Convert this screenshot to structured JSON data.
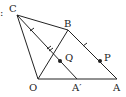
{
  "diagram": {
    "points": {
      "C": {
        "label": "C",
        "x": 17,
        "y": 15,
        "lx": 8,
        "ly": 12
      },
      "B": {
        "label": "B",
        "x": 68,
        "y": 30,
        "lx": 65,
        "ly": 27
      },
      "O": {
        "label": "O",
        "x": 38,
        "y": 79,
        "lx": 30,
        "ly": 91
      },
      "A_prime": {
        "label": "A′",
        "x": 77,
        "y": 79,
        "lx": 72,
        "ly": 91
      },
      "A": {
        "label": "A",
        "x": 117,
        "y": 79,
        "lx": 113,
        "ly": 91
      },
      "Q": {
        "label": "Q",
        "x": 60,
        "y": 61,
        "lx": 65,
        "ly": 61
      },
      "P": {
        "label": "P",
        "x": 100,
        "y": 61,
        "lx": 104,
        "ly": 61
      }
    },
    "segments": [
      "CB",
      "CO",
      "CA′",
      "OB",
      "BA",
      "OA"
    ],
    "marks": "single arrow ticks on BA and CA′ (parallel), double tick on CA′",
    "edge_fragment": ":",
    "stroke_color": "#222222"
  }
}
